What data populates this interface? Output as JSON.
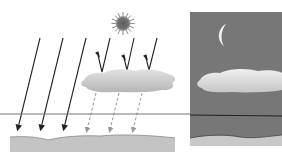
{
  "diagram": {
    "type": "illustration",
    "panels": [
      {
        "id": "day",
        "background": "#ffffff",
        "elements": [
          "sun",
          "direct-sunlight-arrows",
          "reflected-arrows-off-cloud",
          "cloud",
          "dashed-diffuse-arrows",
          "ground"
        ]
      },
      {
        "id": "night",
        "background": "#777777",
        "elements": [
          "moon",
          "cloud",
          "ground"
        ]
      }
    ],
    "colors": {
      "night_sky": "#777777",
      "cloud_day": "#c8c8c8",
      "cloud_night": "#d9d9d9",
      "ground": "#c4c4c4",
      "sun": "#6e6e6e",
      "moon": "#f2f2f2",
      "line": "#333333"
    }
  }
}
